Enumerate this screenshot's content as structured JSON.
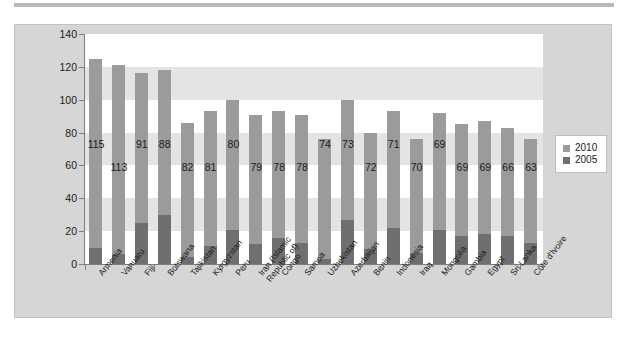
{
  "chart_data": {
    "type": "bar",
    "title": "",
    "subtitle": "",
    "xlabel": "",
    "ylabel": "",
    "ylim": [
      0,
      140
    ],
    "yticks": [
      0,
      20,
      40,
      60,
      80,
      100,
      120,
      140
    ],
    "grid": "horizontal-bands",
    "legend_position": "right",
    "stacked": true,
    "categories": [
      "Armenia",
      "Vanuatu",
      "Fiji",
      "Botswana",
      "Tajikistan",
      "Kyrgyzstan",
      "Peru",
      "Iran (Islamic\nRepublic of)",
      "Congo",
      "Samoa",
      "Uzbekistan",
      "Azerbaijan",
      "Benin",
      "Indonesia",
      "Iraq",
      "Mongolia",
      "Gambia",
      "Egypt",
      "Sri Lanka",
      "Côte d'Ivoire"
    ],
    "series": [
      {
        "name": "2010",
        "color": "#9b9b9b",
        "values": [
          125,
          121,
          116,
          118,
          86,
          93,
          100,
          91,
          93,
          91,
          76,
          100,
          80,
          93,
          76,
          92,
          85,
          87,
          83,
          76
        ]
      },
      {
        "name": "2005",
        "color": "#6f6f6f",
        "values": [
          10,
          6,
          25,
          30,
          4,
          11,
          21,
          12,
          16,
          13,
          3,
          27,
          9,
          22,
          7,
          21,
          17,
          18,
          17,
          13
        ]
      }
    ],
    "data_labels": [
      115,
      113,
      91,
      88,
      82,
      81,
      80,
      79,
      78,
      78,
      74,
      73,
      72,
      71,
      70,
      69,
      69,
      69,
      66,
      63
    ],
    "data_label_stagger": [
      0,
      1,
      0,
      0,
      1,
      1,
      0,
      1,
      1,
      1,
      0,
      0,
      1,
      0,
      1,
      0,
      1,
      1,
      1,
      1
    ]
  },
  "legend": {
    "entries": [
      {
        "label": "2010",
        "color": "#9b9b9b"
      },
      {
        "label": "2005",
        "color": "#6f6f6f"
      }
    ]
  }
}
